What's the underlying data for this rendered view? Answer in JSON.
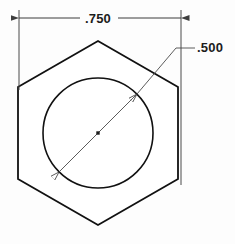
{
  "drawing": {
    "title": "Hex nut section view",
    "background_color": "#fdfdfd",
    "outline_color": "#111111",
    "dimension_color": "#3d3d3d",
    "text_color": "#1c1c1c",
    "shapes": {
      "hexagon": {
        "name": "hex-outline",
        "center_x": 98,
        "center_y": 133,
        "circumradius": 92,
        "orientation": "pointy-top",
        "stroke_width": 1.8,
        "points": "98,41 178,87 178,179 98,225 18,179 18,87"
      },
      "bore_circle": {
        "name": "bore-circle",
        "center_x": 98,
        "center_y": 133,
        "radius": 55,
        "stroke_width": 1.6
      },
      "center_mark": {
        "name": "center-mark",
        "x": 98,
        "y": 133,
        "size": 3.4
      }
    },
    "dimensions": [
      {
        "id": "width-dimension",
        "label": ".750",
        "type": "linear-horizontal",
        "text_x": 98,
        "text_y": 23,
        "line_y": 18,
        "x_start": 19,
        "x_end": 181,
        "gap_left": 80,
        "gap_right": 118,
        "extension_left_x": 19,
        "extension_left_y1": 10,
        "extension_left_y2": 90,
        "extension_right_x": 181,
        "extension_right_y1": 10,
        "extension_right_y2": 185
      },
      {
        "id": "diameter-dimension",
        "label": ".500",
        "type": "diameter-leader",
        "text_x": 198,
        "text_y": 52,
        "leader_elbow_x": 193,
        "leader_elbow_y": 48,
        "leader_bend_x": 176,
        "leader_bend_y": 48,
        "dim_line_x1": 59,
        "dim_line_y1": 172,
        "dim_line_x2": 137,
        "dim_line_y2": 94,
        "arrow_a_x": 59,
        "arrow_a_y": 172,
        "arrow_b_x": 137,
        "arrow_b_y": 94
      }
    ]
  }
}
